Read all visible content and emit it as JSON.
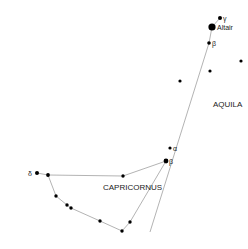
{
  "chart": {
    "constellations": [
      {
        "name": "AQUILA",
        "label_pos": [
          213,
          107
        ]
      },
      {
        "name": "CAPRICORNUS",
        "label_pos": [
          103,
          190
        ]
      }
    ],
    "stars": [
      {
        "id": "gamma-aql",
        "label": "γ",
        "x": 220,
        "y": 18,
        "r": 2,
        "lx": 223,
        "ly": 21
      },
      {
        "id": "altair",
        "label": "Altair",
        "x": 212,
        "y": 27,
        "r": 3.6,
        "lx": 217,
        "ly": 30
      },
      {
        "id": "beta-aql",
        "label": "β",
        "x": 209,
        "y": 43,
        "r": 1.8,
        "lx": 212,
        "ly": 46
      },
      {
        "id": "aql-1",
        "label": "",
        "x": 241,
        "y": 61,
        "r": 1.6
      },
      {
        "id": "aql-2",
        "label": "",
        "x": 210,
        "y": 71,
        "r": 1.6
      },
      {
        "id": "aql-3",
        "label": "",
        "x": 180,
        "y": 81,
        "r": 1.6
      },
      {
        "id": "alpha-cap",
        "label": "α",
        "x": 170,
        "y": 148,
        "r": 1.6,
        "lx": 173,
        "ly": 151
      },
      {
        "id": "beta-cap",
        "label": "β",
        "x": 166,
        "y": 161,
        "r": 2.4,
        "lx": 169,
        "ly": 164
      },
      {
        "id": "delta-cap",
        "label": "δ",
        "x": 37,
        "y": 173,
        "r": 2,
        "lx": 28,
        "ly": 176
      },
      {
        "id": "cap-1",
        "label": "",
        "x": 48,
        "y": 175,
        "r": 1.9
      },
      {
        "id": "cap-2",
        "label": "",
        "x": 123,
        "y": 176,
        "r": 1.7
      },
      {
        "id": "cap-3",
        "label": "",
        "x": 56,
        "y": 196,
        "r": 1.7
      },
      {
        "id": "cap-4",
        "label": "",
        "x": 67,
        "y": 205,
        "r": 1.7
      },
      {
        "id": "cap-5",
        "label": "",
        "x": 71,
        "y": 208,
        "r": 1.7
      },
      {
        "id": "cap-6",
        "label": "",
        "x": 100,
        "y": 221,
        "r": 1.7
      },
      {
        "id": "cap-7",
        "label": "",
        "x": 122,
        "y": 231,
        "r": 1.7
      },
      {
        "id": "cap-8",
        "label": "",
        "x": 130,
        "y": 222,
        "r": 1.7
      }
    ],
    "lines": [
      [
        [
          212,
          27
        ],
        [
          220,
          18
        ]
      ],
      [
        [
          212,
          27
        ],
        [
          209,
          43
        ],
        [
          150,
          232
        ]
      ],
      [
        [
          37,
          173
        ],
        [
          48,
          175
        ],
        [
          123,
          176
        ],
        [
          166,
          161
        ]
      ],
      [
        [
          48,
          175
        ],
        [
          56,
          196
        ],
        [
          67,
          205
        ],
        [
          71,
          208
        ],
        [
          100,
          221
        ],
        [
          122,
          231
        ],
        [
          130,
          222
        ],
        [
          166,
          161
        ]
      ]
    ],
    "colors": {
      "star": "#000000",
      "line": "#aaaaaa",
      "text": "#222222"
    }
  }
}
